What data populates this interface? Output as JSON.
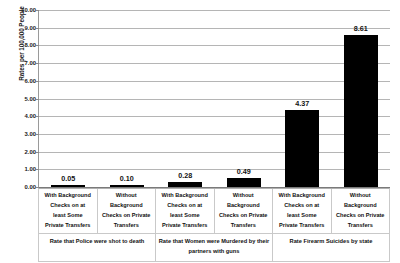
{
  "chart_data": {
    "type": "bar",
    "title": "",
    "subtitle": "",
    "xlabel": "",
    "ylabel": "Rates per 100,000 People",
    "ylim": [
      0,
      10
    ],
    "ytick_step": 1,
    "grid": true,
    "legend": "none",
    "bar_color": "#000000",
    "gridline_color": "#b5b5b5",
    "categories": [
      "With Background Checks on at least Some Private Transfers",
      "Without Background Checks on Private Transfers",
      "With Background Checks on at least Some Private Transfers",
      "Without Background Checks on Private Transfers",
      "With Background Checks on at least Some Private Transfers",
      "Without Background Checks on Private Transfers"
    ],
    "values": [
      0.05,
      0.1,
      0.28,
      0.49,
      4.37,
      8.61
    ],
    "value_labels": [
      "0.05",
      "0.10",
      "0.28",
      "0.49",
      "4.37",
      "8.61"
    ],
    "ytick_labels": [
      "10.00",
      "9.00",
      "8.00",
      "7.00",
      "6.00",
      "5.00",
      "4.00",
      "3.00",
      "2.00",
      "1.00",
      "0.00"
    ],
    "ytick_values": [
      10,
      9,
      8,
      7,
      6,
      5,
      4,
      3,
      2,
      1,
      0
    ],
    "groups": [
      {
        "label": "Rate that Police were shot to death",
        "span": 2
      },
      {
        "label": "Rate that Women were Murdered by their partners with guns",
        "span": 2
      },
      {
        "label": "Rate Firearm Suicides by state",
        "span": 2
      }
    ],
    "category_lines": [
      [
        "With Background",
        "Checks on at",
        "least Some",
        "Private Transfers"
      ],
      [
        "Without",
        "Background",
        "Checks on Private",
        "Transfers"
      ],
      [
        "With Background",
        "Checks on at",
        "least Some",
        "Private Transfers"
      ],
      [
        "Without",
        "Background",
        "Checks on Private",
        "Transfers"
      ],
      [
        "With Background",
        "Checks on at",
        "least Some",
        "Private Transfers"
      ],
      [
        "Without",
        "Background",
        "Checks on Private",
        "Transfers"
      ]
    ]
  }
}
